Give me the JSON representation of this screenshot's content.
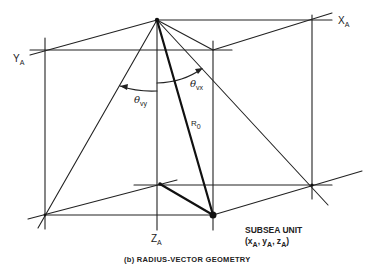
{
  "figure": {
    "caption": "(b) RADIUS-VECTOR GEOMETRY",
    "axes": {
      "x_label": "X",
      "x_sub": "A",
      "y_label": "Y",
      "y_sub": "A",
      "z_label": "Z",
      "z_sub": "A"
    },
    "angles": {
      "theta_vy": {
        "symbol": "θ",
        "sub": "vy"
      },
      "theta_vx": {
        "symbol": "θ",
        "sub": "vx"
      }
    },
    "radius": {
      "symbol": "R",
      "sub": "0"
    },
    "subsea_unit": {
      "title": "SUBSEA UNIT",
      "coords_open": "(x",
      "coords_sub1": "A",
      "coords_mid1": ", y",
      "coords_sub2": "A",
      "coords_mid2": ", z",
      "coords_sub3": "A",
      "coords_close": ")"
    },
    "colors": {
      "line": "#222222",
      "background": "#ffffff"
    }
  }
}
